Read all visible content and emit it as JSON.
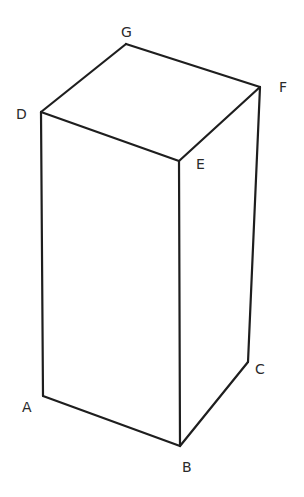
{
  "diagram": {
    "style": "hand-drawn line sketch",
    "colors": {
      "background": "#ffffff",
      "line": "#1e1e1e",
      "label": "#2a2a2a"
    },
    "vertices": [
      "A",
      "B",
      "C",
      "D",
      "E",
      "F",
      "G"
    ],
    "labels": {
      "A": "A",
      "B": "B",
      "C": "C",
      "D": "D",
      "E": "E",
      "F": "F",
      "G": "G"
    },
    "edges": [
      [
        "D",
        "G"
      ],
      [
        "G",
        "F"
      ],
      [
        "F",
        "E"
      ],
      [
        "E",
        "D"
      ],
      [
        "D",
        "A"
      ],
      [
        "E",
        "B"
      ],
      [
        "F",
        "C"
      ],
      [
        "A",
        "B"
      ],
      [
        "B",
        "C"
      ]
    ]
  }
}
